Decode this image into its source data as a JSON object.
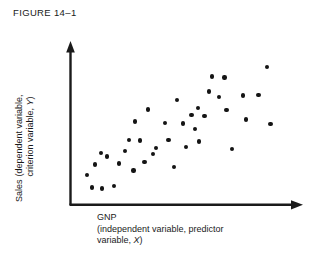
{
  "figure": {
    "title": "FIGURE 14–1"
  },
  "axes": {
    "y_label_primary": "Sales",
    "y_label_sub_line1": "(dependent variable,",
    "y_label_sub_line2": "criterion variable, Y)",
    "y_label_variable_symbol": "Y",
    "x_label_line1": "GNP",
    "x_label_line2": "(independent variable, predictor",
    "x_label_line3": "variable, X)",
    "x_label_variable_symbol": "X",
    "axis_color": "#1a1a1a",
    "y_arrow_icon": "arrow-up-icon",
    "x_arrow_icon": "arrow-right-icon"
  },
  "chart_data": {
    "type": "scatter",
    "title": "FIGURE 14–1",
    "xlabel": "GNP (independent variable, predictor variable, X)",
    "ylabel": "Sales (dependent variable, criterion variable, Y)",
    "grid": false,
    "legend": null,
    "xlim": [
      0,
      100
    ],
    "ylim": [
      0,
      100
    ],
    "axis_ticks": {
      "x": [],
      "y": []
    },
    "point_color": "#141414",
    "point_count": 39,
    "series": [
      {
        "name": "GNP vs Sales observations",
        "points": [
          {
            "x": 9.6,
            "y": 11.2
          },
          {
            "x": 7.3,
            "y": 19.6
          },
          {
            "x": 14.2,
            "y": 10.5
          },
          {
            "x": 19.6,
            "y": 12.1
          },
          {
            "x": 11.1,
            "y": 26.3
          },
          {
            "x": 21.9,
            "y": 26.9
          },
          {
            "x": 16.5,
            "y": 31.7
          },
          {
            "x": 28.4,
            "y": 22.4
          },
          {
            "x": 33.4,
            "y": 28.0
          },
          {
            "x": 31.2,
            "y": 42.0
          },
          {
            "x": 26.4,
            "y": 42.6
          },
          {
            "x": 38.6,
            "y": 37.2
          },
          {
            "x": 29.1,
            "y": 54.5
          },
          {
            "x": 46.7,
            "y": 24.8
          },
          {
            "x": 44.1,
            "y": 42.5
          },
          {
            "x": 42.7,
            "y": 53.5
          },
          {
            "x": 50.8,
            "y": 53.2
          },
          {
            "x": 48.0,
            "y": 68.7
          },
          {
            "x": 54.5,
            "y": 59.0
          },
          {
            "x": 57.4,
            "y": 63.5
          },
          {
            "x": 56.1,
            "y": 49.5
          },
          {
            "x": 58.0,
            "y": 41.5
          },
          {
            "x": 60.3,
            "y": 58.4
          },
          {
            "x": 62.5,
            "y": 74.4
          },
          {
            "x": 63.8,
            "y": 84.2
          },
          {
            "x": 69.4,
            "y": 83.6
          },
          {
            "x": 66.9,
            "y": 70.6
          },
          {
            "x": 70.2,
            "y": 62.0
          },
          {
            "x": 72.8,
            "y": 36.5
          },
          {
            "x": 77.6,
            "y": 71.6
          },
          {
            "x": 79.0,
            "y": 55.8
          },
          {
            "x": 84.6,
            "y": 72.2
          },
          {
            "x": 88.5,
            "y": 90.3
          },
          {
            "x": 90.0,
            "y": 52.8
          },
          {
            "x": 37.2,
            "y": 33.2
          },
          {
            "x": 24.5,
            "y": 35.4
          },
          {
            "x": 13.8,
            "y": 34.0
          },
          {
            "x": 52.0,
            "y": 38.0
          },
          {
            "x": 35.0,
            "y": 62.5
          }
        ]
      }
    ]
  }
}
